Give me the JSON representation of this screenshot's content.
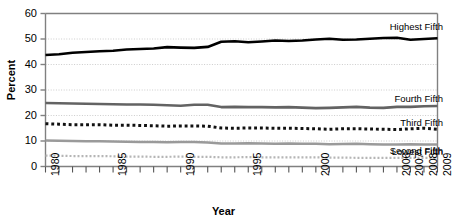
{
  "chart_data": {
    "type": "line",
    "title": "",
    "xlabel": "Year",
    "ylabel": "Percent",
    "ylim": [
      0,
      60
    ],
    "yticks": [
      0,
      10,
      20,
      30,
      40,
      50,
      60
    ],
    "grid": true,
    "legend_position": "inline-right",
    "x": [
      1980,
      1981,
      1982,
      1983,
      1984,
      1985,
      1986,
      1987,
      1988,
      1989,
      1990,
      1991,
      1992,
      1993,
      1994,
      1995,
      1996,
      1997,
      1998,
      1999,
      2000,
      2001,
      2002,
      2003,
      2004,
      2005,
      2006,
      2007,
      2008,
      2009
    ],
    "xtick_labels": [
      "1980",
      "",
      "",
      "",
      "",
      "1985",
      "",
      "",
      "",
      "",
      "1990",
      "",
      "",
      "",
      "",
      "1995",
      "",
      "",
      "",
      "",
      "2000",
      "",
      "",
      "",
      "",
      "",
      "2006",
      "2007",
      "2008",
      "2009"
    ],
    "series": [
      {
        "name": "Highest Fifth",
        "style": "solid",
        "color": "#000000",
        "width": 2.6,
        "values": [
          43.7,
          44.0,
          44.6,
          44.9,
          45.2,
          45.4,
          45.9,
          46.1,
          46.3,
          46.8,
          46.6,
          46.5,
          46.9,
          48.9,
          49.1,
          48.7,
          49.0,
          49.4,
          49.2,
          49.4,
          49.8,
          50.1,
          49.7,
          49.8,
          50.1,
          50.4,
          50.5,
          49.7,
          50.0,
          50.3
        ],
        "label_text": "Highest Fifth"
      },
      {
        "name": "Fourth Fifth",
        "style": "solid",
        "color": "#636363",
        "width": 2.6,
        "values": [
          24.9,
          24.8,
          24.7,
          24.6,
          24.5,
          24.4,
          24.3,
          24.3,
          24.2,
          24.0,
          23.8,
          24.2,
          24.2,
          23.3,
          23.4,
          23.3,
          23.3,
          23.2,
          23.3,
          23.1,
          22.9,
          23.0,
          23.2,
          23.4,
          23.1,
          23.0,
          23.4,
          23.4,
          23.6,
          23.7
        ],
        "label_text": "Fourth Fifth"
      },
      {
        "name": "Third Fifth",
        "style": "square-dotted",
        "color": "#111111",
        "width": 3.0,
        "values": [
          16.8,
          16.6,
          16.4,
          16.4,
          16.4,
          16.2,
          16.2,
          16.1,
          16.0,
          15.8,
          15.9,
          15.9,
          15.8,
          15.1,
          15.0,
          15.1,
          15.1,
          15.0,
          15.0,
          14.9,
          14.8,
          14.6,
          14.8,
          14.8,
          14.7,
          14.6,
          14.5,
          14.8,
          15.0,
          14.6
        ],
        "label_text": "Third Fifth"
      },
      {
        "name": "Second Fifth",
        "style": "solid",
        "color": "#9a9a9a",
        "width": 2.4,
        "values": [
          10.2,
          10.1,
          10.0,
          9.9,
          9.9,
          9.8,
          9.7,
          9.6,
          9.6,
          9.5,
          9.6,
          9.6,
          9.4,
          9.0,
          9.0,
          9.1,
          9.0,
          8.9,
          9.0,
          8.9,
          8.9,
          8.7,
          8.8,
          8.9,
          8.7,
          8.6,
          8.6,
          8.7,
          8.6,
          8.6
        ],
        "label_text": "Second Fifth"
      },
      {
        "name": "Lowest Fifth",
        "style": "fine-dotted",
        "color": "#b5b5b5",
        "width": 2.2,
        "values": [
          4.3,
          4.2,
          4.1,
          4.1,
          4.1,
          4.0,
          3.9,
          3.9,
          3.8,
          3.8,
          3.9,
          3.8,
          3.8,
          3.6,
          3.6,
          3.7,
          3.6,
          3.6,
          3.6,
          3.6,
          3.6,
          3.5,
          3.5,
          3.4,
          3.4,
          3.4,
          3.4,
          3.4,
          3.4,
          3.4
        ],
        "label_text": "Lowest Fifth"
      }
    ]
  },
  "axes": {
    "y_title": "Percent",
    "x_title": "Year",
    "y_tick_labels": [
      "60",
      "50",
      "40",
      "30",
      "20",
      "10",
      "0"
    ]
  },
  "colors": {
    "axis": "#808080",
    "grid": "#cccccc",
    "text": "#000000",
    "background": "#ffffff"
  }
}
